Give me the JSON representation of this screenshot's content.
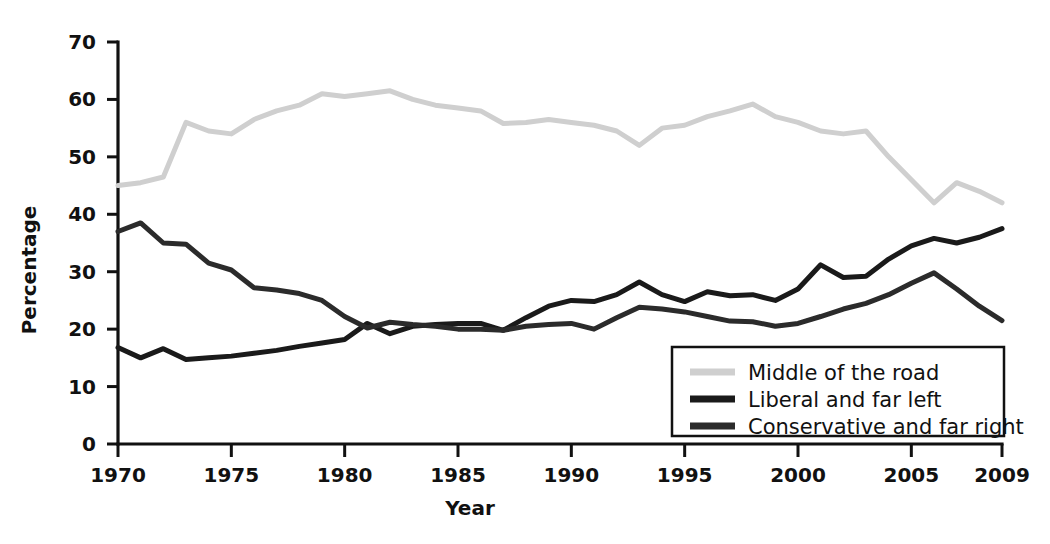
{
  "chart_data": {
    "type": "line",
    "title": "",
    "xlabel": "Year",
    "ylabel": "Percentage",
    "xlim": [
      1970,
      2009
    ],
    "ylim": [
      0,
      70
    ],
    "grid": false,
    "legend_position": "bottom-right",
    "x": [
      1970,
      1971,
      1972,
      1973,
      1974,
      1975,
      1976,
      1977,
      1978,
      1979,
      1980,
      1981,
      1982,
      1983,
      1984,
      1985,
      1986,
      1987,
      1988,
      1989,
      1990,
      1991,
      1992,
      1993,
      1994,
      1995,
      1996,
      1997,
      1998,
      1999,
      2000,
      2001,
      2002,
      2003,
      2004,
      2005,
      2006,
      2007,
      2008,
      2009
    ],
    "xticks": [
      1970,
      1975,
      1980,
      1985,
      1990,
      1995,
      2000,
      2005,
      2009
    ],
    "xticklabels": [
      "1970",
      "1975",
      "1980",
      "1985",
      "1990",
      "1995",
      "2000",
      "2005",
      "2009"
    ],
    "yticks": [
      0,
      10,
      20,
      30,
      40,
      50,
      60,
      70
    ],
    "yticklabels": [
      "0",
      "10",
      "20",
      "30",
      "40",
      "50",
      "60",
      "70"
    ],
    "series": [
      {
        "name": "Middle of the road",
        "color": "#cfcfcf",
        "linewidth": 5,
        "values": [
          45.0,
          45.5,
          46.5,
          56.0,
          54.5,
          54.0,
          56.5,
          58.0,
          59.0,
          61.0,
          60.5,
          61.0,
          61.5,
          60.0,
          59.0,
          58.5,
          58.0,
          55.8,
          56.0,
          56.5,
          56.0,
          55.5,
          54.5,
          52.0,
          55.0,
          55.5,
          57.0,
          58.0,
          59.2,
          57.0,
          56.0,
          54.5,
          54.0,
          54.5,
          50.0,
          46.0,
          42.0,
          45.5,
          44.0,
          42.0
        ]
      },
      {
        "name": "Liberal and far left",
        "color": "#1a1a1a",
        "linewidth": 5,
        "values": [
          16.8,
          15.0,
          16.6,
          14.7,
          15.0,
          15.3,
          15.8,
          16.3,
          17.0,
          17.6,
          18.2,
          21.0,
          19.2,
          20.5,
          20.8,
          21.0,
          21.0,
          19.8,
          22.0,
          24.0,
          25.0,
          24.8,
          26.0,
          28.2,
          26.0,
          24.8,
          26.5,
          25.8,
          26.0,
          25.0,
          27.0,
          31.2,
          29.0,
          29.2,
          32.2,
          34.5,
          35.8,
          35.0,
          36.0,
          37.5
        ]
      },
      {
        "name": "Conservative and far right",
        "color": "#2b2b2b",
        "linewidth": 5,
        "values": [
          37.0,
          38.5,
          35.0,
          34.8,
          31.5,
          30.3,
          27.2,
          26.8,
          26.2,
          25.0,
          22.2,
          20.2,
          21.2,
          20.8,
          20.5,
          20.0,
          20.0,
          19.8,
          20.5,
          20.8,
          21.0,
          20.0,
          22.0,
          23.8,
          23.5,
          23.0,
          22.2,
          21.4,
          21.3,
          20.5,
          21.0,
          22.2,
          23.5,
          24.5,
          26.0,
          28.0,
          29.8,
          27.0,
          24.0,
          21.5
        ]
      }
    ]
  }
}
